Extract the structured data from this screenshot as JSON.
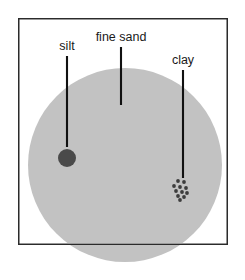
{
  "figure": {
    "background_color": "#ffffff",
    "frame": {
      "x": 18,
      "y": 18,
      "width": 210,
      "height": 227,
      "stroke_color": "#2b2b2b",
      "stroke_width": 1.3,
      "fill": "#ffffff"
    },
    "matrix_circle": {
      "name": "fine sand grain",
      "cx": 125,
      "cy": 165,
      "r": 97,
      "fill_color": "#c2c2c2"
    },
    "labels": [
      {
        "id": "silt",
        "text": "silt",
        "text_x": 67,
        "text_y": 50,
        "line_x": 67,
        "line_y1": 56,
        "line_y2": 147,
        "line_color": "#111111",
        "line_width": 2.1
      },
      {
        "id": "fine-sand",
        "text": "fine sand",
        "text_x": 121,
        "text_y": 41,
        "line_x": 121,
        "line_y1": 47,
        "line_y2": 105,
        "line_color": "#111111",
        "line_width": 2.1
      },
      {
        "id": "clay",
        "text": "clay",
        "text_x": 183,
        "text_y": 64,
        "line_x": 183,
        "line_y1": 70,
        "line_y2": 178,
        "line_color": "#111111",
        "line_width": 2.1
      }
    ],
    "silt_particle": {
      "cx": 67,
      "cy": 158,
      "r": 9,
      "fill_color": "#4a4a4a"
    },
    "clay_particles": {
      "fill_color": "#3d3d3d",
      "r": 1.9,
      "points": [
        {
          "cx": 178,
          "cy": 181
        },
        {
          "cx": 184,
          "cy": 182
        },
        {
          "cx": 174,
          "cy": 186
        },
        {
          "cx": 180,
          "cy": 187
        },
        {
          "cx": 186,
          "cy": 188
        },
        {
          "cx": 176,
          "cy": 191
        },
        {
          "cx": 182,
          "cy": 192
        },
        {
          "cx": 187,
          "cy": 193
        },
        {
          "cx": 178,
          "cy": 196
        },
        {
          "cx": 184,
          "cy": 197
        },
        {
          "cx": 180,
          "cy": 200
        }
      ]
    }
  }
}
